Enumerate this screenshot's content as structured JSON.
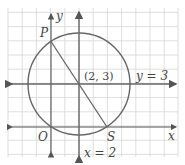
{
  "diagram": {
    "type": "coordinate-plane-circle",
    "grid": {
      "unit_px": 14.2,
      "origin_px": [
        51,
        127
      ],
      "x_range": [
        -3,
        9
      ],
      "y_range": [
        -2,
        8
      ],
      "color": "#d4d4d4"
    },
    "axes": {
      "x_label": "x",
      "y_label": "y",
      "color": "#555555"
    },
    "circle": {
      "center": [
        2,
        3
      ],
      "radius_sq": 13,
      "color": "#666666"
    },
    "lines": [
      {
        "name": "horizontal-line",
        "equation": "y = 3",
        "label": "y = 3"
      },
      {
        "name": "vertical-line",
        "equation": "x = 2",
        "label": "x = 2"
      }
    ],
    "segment": {
      "from": "P",
      "to": "S",
      "color": "#666666"
    },
    "points": [
      {
        "name": "P",
        "label": "P",
        "coords": [
          0,
          6
        ]
      },
      {
        "name": "center",
        "label": "(2, 3)",
        "coords": [
          2,
          3
        ]
      },
      {
        "name": "O",
        "label": "O",
        "coords": [
          0,
          0
        ]
      },
      {
        "name": "S",
        "label": "S",
        "coords": [
          4,
          0
        ]
      }
    ]
  }
}
